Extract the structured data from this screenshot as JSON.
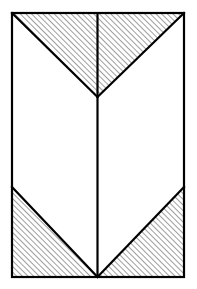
{
  "figure": {
    "canvas": {
      "width": 197,
      "height": 289
    },
    "colors": {
      "background": "#ffffff",
      "stroke": "#000000",
      "fill": "#ffffff",
      "hatch": "#1a1a1a"
    },
    "style": {
      "outline_stroke_width": 2.2,
      "inner_stroke_width": 2.2,
      "hatch_stroke_width": 0.85,
      "hatch_spacing": 4,
      "hatch_angle_deg": 45,
      "hatch_direction": "forward-slash"
    },
    "geometry": {
      "rect": {
        "x": 12,
        "y": 13,
        "width": 172,
        "height": 264
      },
      "rect_corners": {
        "top_left": [
          12,
          13
        ],
        "top_right": [
          184,
          13
        ],
        "bottom_right": [
          184,
          277
        ],
        "bottom_left": [
          12,
          277
        ]
      },
      "center_line": {
        "x": 97.5,
        "y1": 13,
        "y2": 277
      },
      "chevron_apex": [
        97.5,
        97
      ],
      "lower_diagonal_start_y": 187
    },
    "shapes": [
      {
        "name": "top-left-hatched-triangle",
        "label": "Top left triangle",
        "points": "12,13 97.5,13 97.5,97",
        "hatched": true
      },
      {
        "name": "top-right-hatched-triangle",
        "label": "Top right triangle",
        "points": "97.5,13 184,13 97.5,97",
        "hatched": true
      },
      {
        "name": "bottom-left-hatched-triangle",
        "label": "Bottom left triangle",
        "points": "12,187 97.5,277 12,277",
        "hatched": true
      },
      {
        "name": "bottom-right-hatched-triangle",
        "label": "Bottom right triangle",
        "points": "184,187 184,277 97.5,277",
        "hatched": true
      },
      {
        "name": "center-white-chevron-region",
        "label": "Central unshaded region",
        "points": "12,13 97.5,97 184,13 184,187 97.5,277 12,187",
        "hatched": false
      }
    ],
    "edges": [
      {
        "name": "outline-rectangle",
        "label": "Outer rectangle border"
      },
      {
        "name": "center-vertical-divider",
        "label": "Vertical centre line"
      },
      {
        "name": "top-left-diagonal",
        "label": "Top left diagonal",
        "x1": 12,
        "y1": 13,
        "x2": 97.5,
        "y2": 97
      },
      {
        "name": "top-right-diagonal",
        "label": "Top right diagonal",
        "x1": 184,
        "y1": 13,
        "x2": 97.5,
        "y2": 97
      },
      {
        "name": "bottom-left-diagonal",
        "label": "Bottom left diagonal",
        "x1": 12,
        "y1": 187,
        "x2": 97.5,
        "y2": 277
      },
      {
        "name": "bottom-right-diagonal",
        "label": "Bottom right diagonal",
        "x1": 184,
        "y1": 187,
        "x2": 97.5,
        "y2": 277
      }
    ]
  }
}
